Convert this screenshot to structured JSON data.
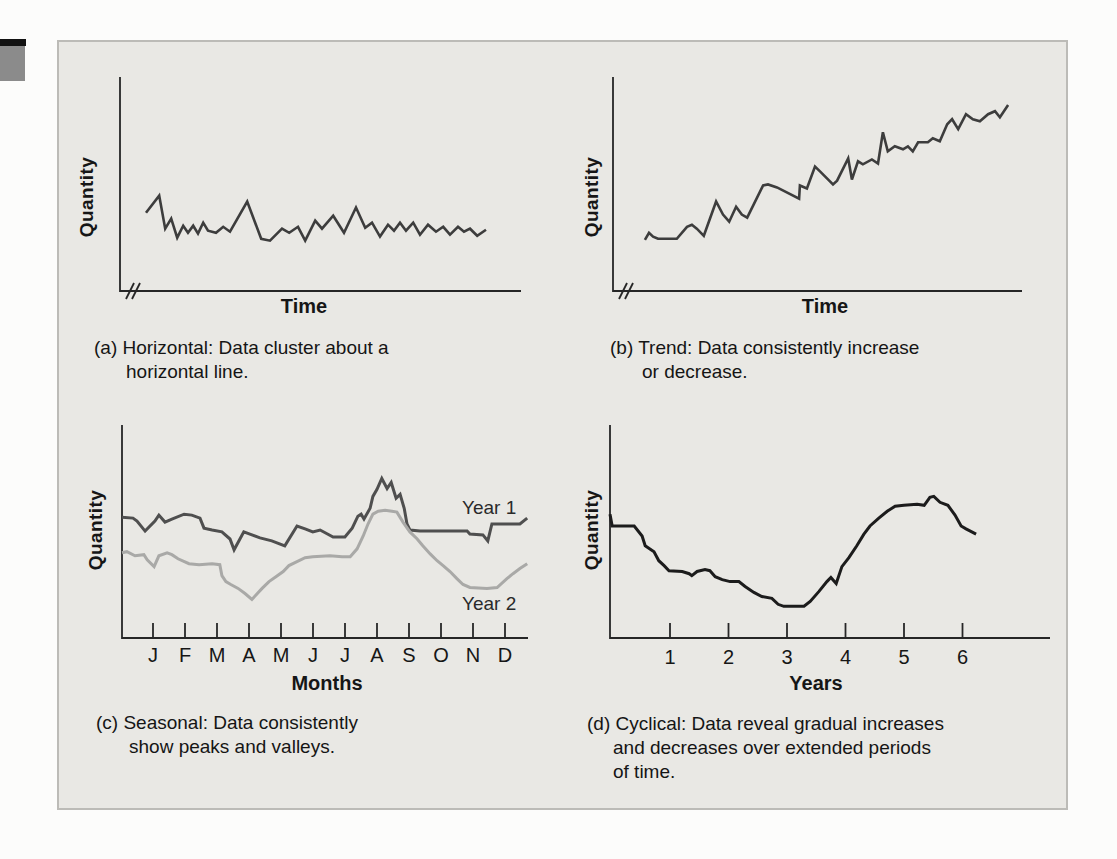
{
  "page": {
    "background": "#fcfcfb"
  },
  "panel": {
    "background": "#e9e8e4",
    "border_color": "#bcbbb7"
  },
  "edge_tab": {
    "bar_color": "#121212",
    "square_color": "#8b8b8b"
  },
  "axis": {
    "color": "#262626"
  },
  "point_units": "x and y are percent of axis length; axes are unlabeled qualitative sketches",
  "chart_data": [
    {
      "id": "a",
      "type": "line",
      "pattern": "horizontal",
      "xlabel": "Time",
      "ylabel": "Quantity",
      "axis_break": true,
      "grid": false,
      "x_ticks": [],
      "caption_lines": [
        "(a) Horizontal: Data cluster about a",
        "horizontal line."
      ],
      "series": [
        {
          "name": "demand",
          "color": "#3d3d3d",
          "width": 2.6,
          "points": [
            [
              6.5,
              36.6
            ],
            [
              9.8,
              44.6
            ],
            [
              11.3,
              29.1
            ],
            [
              12.8,
              33.8
            ],
            [
              14.3,
              24.9
            ],
            [
              15.8,
              30.5
            ],
            [
              17.0,
              27.2
            ],
            [
              18.3,
              30.5
            ],
            [
              19.5,
              26.8
            ],
            [
              20.8,
              31.9
            ],
            [
              22.0,
              28.2
            ],
            [
              24.0,
              27.2
            ],
            [
              25.8,
              30.0
            ],
            [
              27.5,
              27.7
            ],
            [
              31.8,
              41.8
            ],
            [
              35.3,
              24.4
            ],
            [
              37.5,
              23.5
            ],
            [
              40.5,
              29.1
            ],
            [
              42.3,
              27.2
            ],
            [
              44.5,
              30.0
            ],
            [
              46.3,
              23.5
            ],
            [
              48.8,
              32.9
            ],
            [
              50.5,
              29.1
            ],
            [
              53.3,
              35.2
            ],
            [
              56.0,
              27.2
            ],
            [
              59.0,
              39.0
            ],
            [
              61.3,
              29.6
            ],
            [
              63.0,
              31.9
            ],
            [
              65.0,
              25.4
            ],
            [
              67.0,
              31.0
            ],
            [
              68.5,
              28.2
            ],
            [
              70.0,
              31.9
            ],
            [
              71.5,
              28.2
            ],
            [
              73.3,
              31.9
            ],
            [
              75.0,
              26.3
            ],
            [
              77.0,
              31.0
            ],
            [
              79.0,
              27.7
            ],
            [
              80.8,
              30.0
            ],
            [
              82.5,
              26.3
            ],
            [
              84.5,
              30.0
            ],
            [
              86.0,
              27.7
            ],
            [
              87.5,
              29.1
            ],
            [
              89.3,
              25.8
            ],
            [
              91.5,
              28.6
            ]
          ]
        }
      ]
    },
    {
      "id": "b",
      "type": "line",
      "pattern": "trend",
      "xlabel": "Time",
      "ylabel": "Quantity",
      "axis_break": true,
      "grid": false,
      "x_ticks": [],
      "caption_lines": [
        "(b) Trend: Data consistently increase",
        "or decrease."
      ],
      "series": [
        {
          "name": "demand",
          "color": "#3d3d3d",
          "width": 2.6,
          "points": [
            [
              7.8,
              23.9
            ],
            [
              8.8,
              27.2
            ],
            [
              9.8,
              25.4
            ],
            [
              11.0,
              24.4
            ],
            [
              15.6,
              24.4
            ],
            [
              18.1,
              30.0
            ],
            [
              19.3,
              31.0
            ],
            [
              20.5,
              29.1
            ],
            [
              22.2,
              25.8
            ],
            [
              25.2,
              41.8
            ],
            [
              26.9,
              35.7
            ],
            [
              28.4,
              32.4
            ],
            [
              30.1,
              39.4
            ],
            [
              31.5,
              35.7
            ],
            [
              32.8,
              34.3
            ],
            [
              36.7,
              49.3
            ],
            [
              37.9,
              49.8
            ],
            [
              40.1,
              48.4
            ],
            [
              45.5,
              43.2
            ],
            [
              45.7,
              49.3
            ],
            [
              47.4,
              47.9
            ],
            [
              49.4,
              58.2
            ],
            [
              50.6,
              55.9
            ],
            [
              53.8,
              49.8
            ],
            [
              54.8,
              51.6
            ],
            [
              57.5,
              62.0
            ],
            [
              58.4,
              52.1
            ],
            [
              59.9,
              60.6
            ],
            [
              61.1,
              59.2
            ],
            [
              63.3,
              61.5
            ],
            [
              64.8,
              59.6
            ],
            [
              66.0,
              74.2
            ],
            [
              67.2,
              65.3
            ],
            [
              68.9,
              67.6
            ],
            [
              70.9,
              66.2
            ],
            [
              72.1,
              67.6
            ],
            [
              73.3,
              65.3
            ],
            [
              74.6,
              69.5
            ],
            [
              77.0,
              69.5
            ],
            [
              78.2,
              71.4
            ],
            [
              79.9,
              70.0
            ],
            [
              81.7,
              77.9
            ],
            [
              82.9,
              80.3
            ],
            [
              84.4,
              75.6
            ],
            [
              86.3,
              82.6
            ],
            [
              88.0,
              80.3
            ],
            [
              89.7,
              79.3
            ],
            [
              91.7,
              82.6
            ],
            [
              93.4,
              84.0
            ],
            [
              94.6,
              81.2
            ],
            [
              96.6,
              86.9
            ]
          ]
        }
      ]
    },
    {
      "id": "c",
      "type": "line",
      "pattern": "seasonal",
      "xlabel": "Months",
      "ylabel": "Quantity",
      "axis_break": false,
      "grid": false,
      "x_ticks": [
        "J",
        "F",
        "M",
        "A",
        "M",
        "J",
        "J",
        "A",
        "S",
        "O",
        "N",
        "D"
      ],
      "legend_position": "right-of-lines",
      "caption_lines": [
        "(c) Seasonal: Data consistently",
        "show peaks and valleys."
      ],
      "series": [
        {
          "name": "Year 1",
          "color": "#4f4f4f",
          "width": 3,
          "points": [
            [
              0,
              56.7
            ],
            [
              2.7,
              56.3
            ],
            [
              3.7,
              54.9
            ],
            [
              5.7,
              50.2
            ],
            [
              8.1,
              54.9
            ],
            [
              9.1,
              57.7
            ],
            [
              10.6,
              54.4
            ],
            [
              12.3,
              55.8
            ],
            [
              15.3,
              58.1
            ],
            [
              17.2,
              57.7
            ],
            [
              19.2,
              56.3
            ],
            [
              20.2,
              51.6
            ],
            [
              22.2,
              50.7
            ],
            [
              24.6,
              49.8
            ],
            [
              26.6,
              46.5
            ],
            [
              27.6,
              41.4
            ],
            [
              30.0,
              49.8
            ],
            [
              31.5,
              48.8
            ],
            [
              34.0,
              47.0
            ],
            [
              36.9,
              45.6
            ],
            [
              40.1,
              43.3
            ],
            [
              43.1,
              52.6
            ],
            [
              45.1,
              51.2
            ],
            [
              47.0,
              49.8
            ],
            [
              48.8,
              50.7
            ],
            [
              52.0,
              47.4
            ],
            [
              54.9,
              47.4
            ],
            [
              56.7,
              51.6
            ],
            [
              58.1,
              57.2
            ],
            [
              58.9,
              58.1
            ],
            [
              59.6,
              55.8
            ],
            [
              61.1,
              60.9
            ],
            [
              61.8,
              66.5
            ],
            [
              62.8,
              69.8
            ],
            [
              64.0,
              74.9
            ],
            [
              65.3,
              70.2
            ],
            [
              66.3,
              73.0
            ],
            [
              67.5,
              65.6
            ],
            [
              68.5,
              67.4
            ],
            [
              69.5,
              60.9
            ],
            [
              70.2,
              53.5
            ],
            [
              70.9,
              50.7
            ],
            [
              73.4,
              50.2
            ],
            [
              79.6,
              50.2
            ],
            [
              85.0,
              50.2
            ],
            [
              85.7,
              48.8
            ],
            [
              88.9,
              48.4
            ],
            [
              90.1,
              45.6
            ],
            [
              91.1,
              53.5
            ],
            [
              98.0,
              53.5
            ],
            [
              99.8,
              56.3
            ]
          ]
        },
        {
          "name": "Year 2",
          "color": "#a9a9a7",
          "width": 3,
          "points": [
            [
              0,
              40.0
            ],
            [
              1.2,
              40.5
            ],
            [
              3.2,
              38.6
            ],
            [
              5.4,
              39.1
            ],
            [
              6.2,
              36.7
            ],
            [
              7.9,
              33.5
            ],
            [
              9.1,
              38.6
            ],
            [
              11.1,
              40.0
            ],
            [
              12.3,
              39.1
            ],
            [
              13.8,
              37.2
            ],
            [
              16.5,
              34.9
            ],
            [
              19.0,
              34.4
            ],
            [
              22.2,
              34.9
            ],
            [
              24.1,
              34.4
            ],
            [
              24.6,
              29.3
            ],
            [
              25.6,
              26.5
            ],
            [
              26.8,
              25.1
            ],
            [
              28.6,
              23.3
            ],
            [
              30.3,
              20.9
            ],
            [
              32.0,
              18.1
            ],
            [
              34.5,
              23.3
            ],
            [
              36.2,
              26.5
            ],
            [
              37.9,
              28.8
            ],
            [
              39.7,
              31.2
            ],
            [
              41.1,
              34.0
            ],
            [
              43.1,
              35.8
            ],
            [
              45.1,
              37.7
            ],
            [
              47.0,
              38.1
            ],
            [
              51.2,
              38.6
            ],
            [
              54.2,
              38.1
            ],
            [
              56.2,
              38.1
            ],
            [
              57.9,
              41.9
            ],
            [
              59.4,
              47.9
            ],
            [
              60.6,
              53.5
            ],
            [
              61.8,
              58.1
            ],
            [
              63.1,
              59.5
            ],
            [
              64.8,
              60.0
            ],
            [
              66.5,
              59.5
            ],
            [
              67.7,
              59.1
            ],
            [
              69.2,
              54.4
            ],
            [
              70.9,
              49.8
            ],
            [
              72.7,
              46.5
            ],
            [
              74.1,
              43.3
            ],
            [
              75.9,
              39.5
            ],
            [
              77.6,
              36.3
            ],
            [
              79.1,
              34.0
            ],
            [
              80.8,
              31.2
            ],
            [
              82.5,
              27.9
            ],
            [
              84.0,
              25.1
            ],
            [
              85.7,
              23.7
            ],
            [
              89.9,
              23.3
            ],
            [
              92.4,
              23.7
            ],
            [
              94.8,
              27.9
            ],
            [
              96.3,
              30.2
            ],
            [
              98.0,
              32.6
            ],
            [
              99.8,
              34.9
            ]
          ]
        }
      ]
    },
    {
      "id": "d",
      "type": "line",
      "pattern": "cyclical",
      "xlabel": "Years",
      "ylabel": "Quantity",
      "axis_break": false,
      "grid": false,
      "x_ticks": [
        "1",
        "2",
        "3",
        "4",
        "5",
        "6"
      ],
      "caption_lines": [
        "(d) Cyclical: Data reveal gradual increases",
        "and decreases over extended periods",
        "of time."
      ],
      "series": [
        {
          "name": "demand",
          "color": "#1c1c1c",
          "width": 3,
          "points": [
            [
              0,
              58.1
            ],
            [
              0.5,
              52.6
            ],
            [
              5.5,
              52.6
            ],
            [
              7.3,
              47.9
            ],
            [
              8.0,
              43.3
            ],
            [
              10.0,
              40.5
            ],
            [
              11.1,
              36.3
            ],
            [
              12.3,
              34.0
            ],
            [
              13.4,
              31.6
            ],
            [
              16.4,
              31.2
            ],
            [
              18.0,
              30.2
            ],
            [
              18.6,
              29.3
            ],
            [
              19.8,
              31.2
            ],
            [
              21.6,
              32.1
            ],
            [
              22.7,
              31.6
            ],
            [
              23.9,
              28.8
            ],
            [
              25.5,
              27.4
            ],
            [
              27.3,
              26.5
            ],
            [
              29.3,
              26.5
            ],
            [
              30.7,
              24.2
            ],
            [
              32.7,
              21.4
            ],
            [
              34.5,
              19.5
            ],
            [
              36.8,
              18.6
            ],
            [
              38.2,
              15.8
            ],
            [
              39.5,
              14.9
            ],
            [
              44.1,
              14.9
            ],
            [
              45.5,
              17.2
            ],
            [
              47.5,
              21.9
            ],
            [
              49.3,
              26.5
            ],
            [
              50.2,
              28.4
            ],
            [
              51.4,
              25.6
            ],
            [
              52.7,
              33.5
            ],
            [
              54.3,
              37.7
            ],
            [
              56.1,
              43.3
            ],
            [
              57.7,
              48.8
            ],
            [
              59.1,
              52.6
            ],
            [
              61.1,
              56.3
            ],
            [
              63.0,
              59.5
            ],
            [
              64.8,
              61.9
            ],
            [
              66.8,
              62.3
            ],
            [
              69.8,
              62.8
            ],
            [
              71.4,
              62.3
            ],
            [
              72.7,
              66.0
            ],
            [
              73.6,
              66.5
            ],
            [
              75.0,
              63.7
            ],
            [
              76.8,
              62.3
            ],
            [
              78.4,
              57.7
            ],
            [
              79.8,
              52.6
            ],
            [
              80.9,
              51.2
            ],
            [
              83.2,
              48.8
            ]
          ]
        }
      ]
    }
  ]
}
